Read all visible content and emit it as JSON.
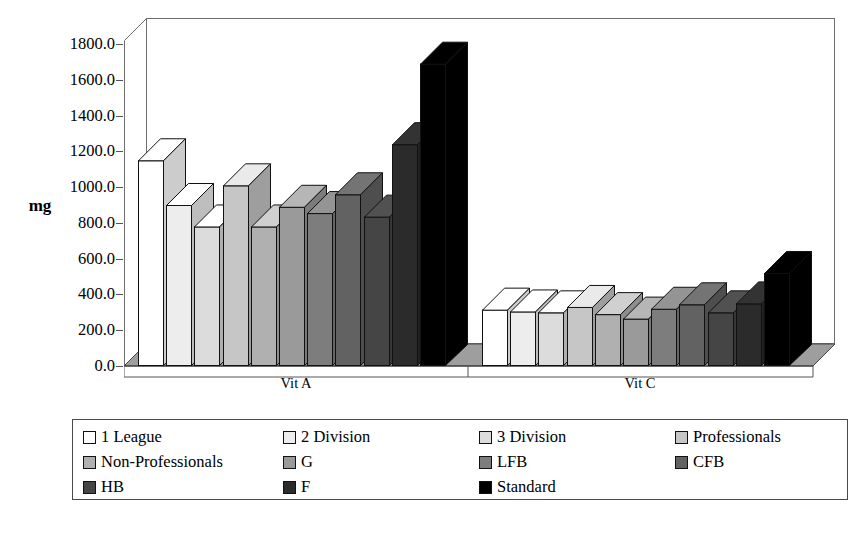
{
  "chart_data": {
    "type": "bar",
    "title": "",
    "subtitle": "",
    "xlabel": "",
    "ylabel": "mg",
    "categories": [
      "Vit A",
      "Vit C"
    ],
    "ylim": [
      0,
      1800
    ],
    "ytick_step": 200,
    "ytick_labels": [
      "0.0",
      "200.0",
      "400.0",
      "600.0",
      "800.0",
      "1000.0",
      "1200.0",
      "1400.0",
      "1600.0",
      "1800.0"
    ],
    "grid": false,
    "legend_position": "bottom",
    "style": "3d-column",
    "series": [
      {
        "name": "1 League",
        "color": "#ffffff",
        "values": [
          1150,
          315
        ]
      },
      {
        "name": "2 Division",
        "color": "#ededed",
        "values": [
          900,
          305
        ]
      },
      {
        "name": "3 Division",
        "color": "#dcdcdc",
        "values": [
          780,
          300
        ]
      },
      {
        "name": "Professionals",
        "color": "#c6c6c6",
        "values": [
          1010,
          330
        ]
      },
      {
        "name": "Non-Professionals",
        "color": "#b0b0b0",
        "values": [
          780,
          290
        ]
      },
      {
        "name": "G",
        "color": "#9a9a9a",
        "values": [
          890,
          265
        ]
      },
      {
        "name": "LFB",
        "color": "#7d7d7d",
        "values": [
          855,
          320
        ]
      },
      {
        "name": "CFB",
        "color": "#626262",
        "values": [
          960,
          345
        ]
      },
      {
        "name": "HB",
        "color": "#454545",
        "values": [
          835,
          300
        ]
      },
      {
        "name": "F",
        "color": "#2b2b2b",
        "values": [
          1240,
          350
        ]
      },
      {
        "name": "Standard",
        "color": "#000000",
        "values": [
          1690,
          520
        ]
      }
    ]
  },
  "axis": {
    "y_title": "mg"
  }
}
